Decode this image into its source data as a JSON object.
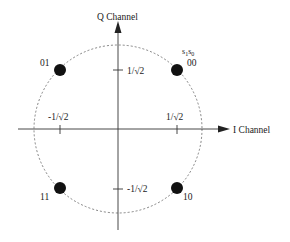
{
  "diagram": {
    "axes": {
      "x_label": "I Channel",
      "y_label": "Q Channel"
    },
    "ticks": {
      "x_pos": "1/√2",
      "x_neg": "-1/√2",
      "y_pos": "1/√2",
      "y_neg": "-1/√2"
    },
    "legend_bits": "s1s0",
    "legend_bits_parts": [
      "s",
      "1",
      "s",
      "0"
    ],
    "points": [
      {
        "label": "00",
        "i": "1/√2",
        "q": "1/√2"
      },
      {
        "label": "01",
        "i": "-1/√2",
        "q": "1/√2"
      },
      {
        "label": "11",
        "i": "-1/√2",
        "q": "-1/√2"
      },
      {
        "label": "10",
        "i": "1/√2",
        "q": "-1/√2"
      }
    ],
    "colors": {
      "axis": "#333333",
      "circle": "#555555",
      "point": "#111111",
      "text": "#1a1a1a"
    }
  }
}
